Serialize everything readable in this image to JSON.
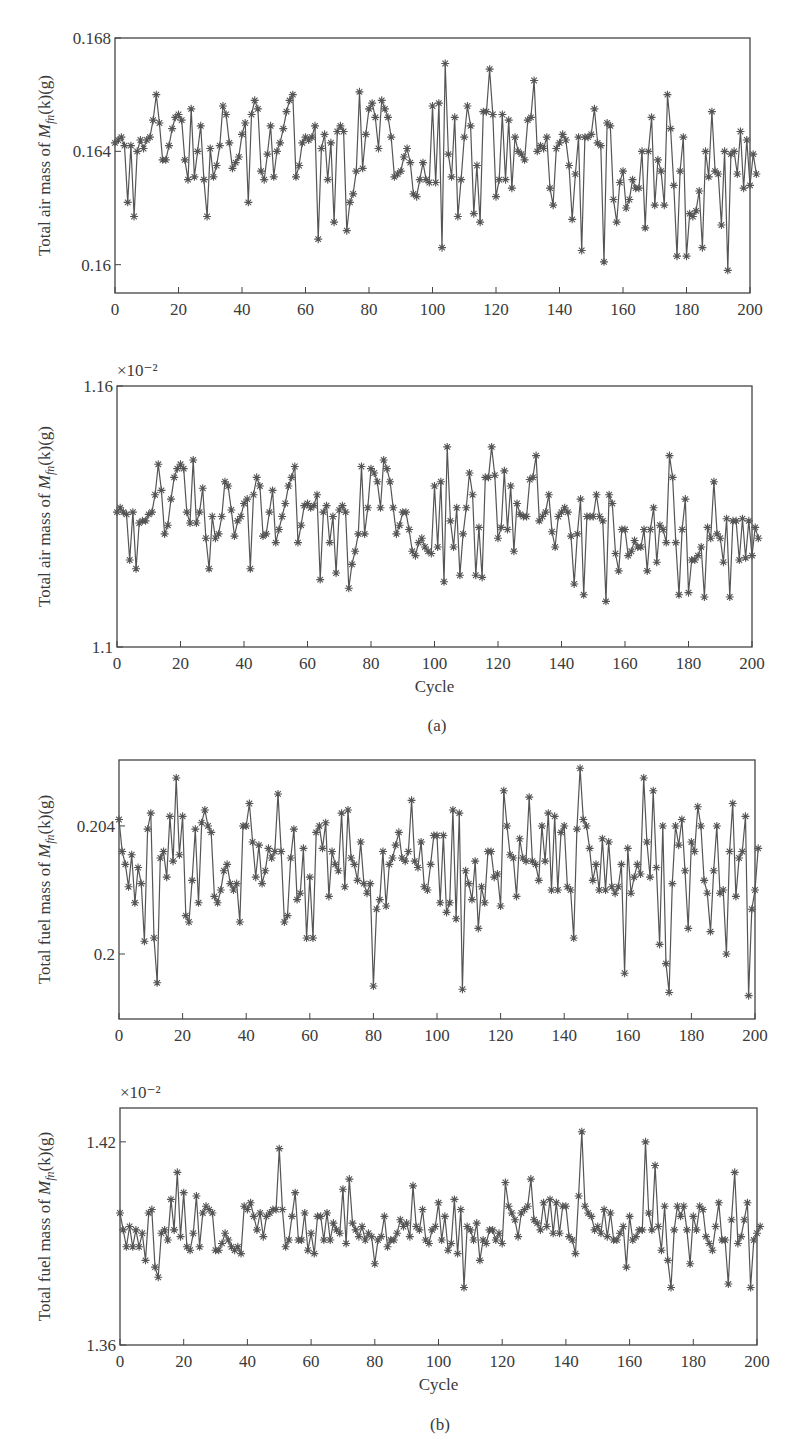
{
  "figure": {
    "panel_a_label": "(a)",
    "panel_b_label": "(b)"
  },
  "chart_data": [
    {
      "id": "air-main",
      "type": "line",
      "marker": "asterisk",
      "color": "#555555",
      "title": "",
      "xlabel": "",
      "ylabel": "Total air mass of M_fn(k)(g)",
      "ylabel_parts": {
        "pre": "Total air mass of ",
        "sym": "M",
        "sub": "fn",
        "post": "(k)(g)"
      },
      "multiplier": "",
      "xlim": [
        0,
        200
      ],
      "ylim": [
        0.159,
        0.168
      ],
      "xticks": [
        0,
        20,
        40,
        60,
        80,
        100,
        120,
        140,
        160,
        180,
        200
      ],
      "yticks": [
        0.16,
        0.164,
        0.168
      ],
      "ytick_labels": [
        "0.16",
        "0.164",
        "0.168"
      ],
      "box": {
        "x": 115,
        "y": 38,
        "w": 635,
        "h": 255
      },
      "grid": false,
      "x": "0..200",
      "values": [
        0.1643,
        0.1644,
        0.1645,
        0.1642,
        0.1622,
        0.1642,
        0.1617,
        0.164,
        0.1644,
        0.1641,
        0.1644,
        0.1645,
        0.1651,
        0.166,
        0.165,
        0.1637,
        0.1637,
        0.1642,
        0.1648,
        0.1652,
        0.1653,
        0.1651,
        0.1637,
        0.163,
        0.1655,
        0.1631,
        0.164,
        0.1649,
        0.163,
        0.1617,
        0.1641,
        0.1631,
        0.1635,
        0.1642,
        0.1656,
        0.1653,
        0.1643,
        0.1634,
        0.1636,
        0.1638,
        0.1646,
        0.165,
        0.1622,
        0.1653,
        0.1658,
        0.1655,
        0.1633,
        0.163,
        0.1639,
        0.1649,
        0.1631,
        0.164,
        0.1643,
        0.1648,
        0.1654,
        0.1658,
        0.166,
        0.1631,
        0.1635,
        0.1643,
        0.1645,
        0.1644,
        0.1645,
        0.1649,
        0.1609,
        0.1641,
        0.1646,
        0.163,
        0.1643,
        0.1615,
        0.1647,
        0.1649,
        0.1647,
        0.1612,
        0.1622,
        0.1625,
        0.1633,
        0.1661,
        0.1634,
        0.1646,
        0.1655,
        0.1657,
        0.1652,
        0.1641,
        0.1658,
        0.1655,
        0.1652,
        0.1645,
        0.1631,
        0.1632,
        0.1633,
        0.1638,
        0.1641,
        0.1636,
        0.1625,
        0.1624,
        0.163,
        0.1636,
        0.163,
        0.1629,
        0.1656,
        0.1629,
        0.1657,
        0.1606,
        0.1671,
        0.1639,
        0.1631,
        0.1652,
        0.1617,
        0.163,
        0.1645,
        0.1656,
        0.1649,
        0.1618,
        0.1635,
        0.1615,
        0.1654,
        0.1654,
        0.1669,
        0.1653,
        0.1624,
        0.163,
        0.1653,
        0.163,
        0.1651,
        0.1627,
        0.1645,
        0.164,
        0.1639,
        0.1637,
        0.1651,
        0.1652,
        0.1665,
        0.164,
        0.1642,
        0.1641,
        0.1645,
        0.1627,
        0.1621,
        0.1641,
        0.1643,
        0.1646,
        0.1644,
        0.1635,
        0.1616,
        0.1632,
        0.1645,
        0.1605,
        0.1645,
        0.1645,
        0.1646,
        0.1655,
        0.1643,
        0.1642,
        0.1601,
        0.165,
        0.1649,
        0.1623,
        0.1615,
        0.1629,
        0.1633,
        0.162,
        0.1623,
        0.163,
        0.1627,
        0.1627,
        0.164,
        0.1613,
        0.164,
        0.1652,
        0.1621,
        0.1637,
        0.1633,
        0.1621,
        0.166,
        0.1648,
        0.1628,
        0.1603,
        0.1633,
        0.1645,
        0.1603,
        0.1618,
        0.1617,
        0.1619,
        0.1626,
        0.1606,
        0.164,
        0.1631,
        0.1654,
        0.1633,
        0.1632,
        0.1614,
        0.164,
        0.1598,
        0.1639,
        0.164,
        0.1632,
        0.1647,
        0.1627,
        0.1644,
        0.1628,
        0.1639,
        0.1632
      ]
    },
    {
      "id": "air-scaled",
      "type": "line",
      "marker": "asterisk",
      "color": "#555555",
      "title": "",
      "xlabel": "Cycle",
      "ylabel": "Total air mass of M_fn(k)(g)",
      "ylabel_parts": {
        "pre": "Total air mass of ",
        "sym": "M",
        "sub": "fn",
        "post": "(k)(g)"
      },
      "multiplier": "×10⁻²",
      "xlim": [
        0,
        200
      ],
      "ylim": [
        1.1,
        1.16
      ],
      "xticks": [
        0,
        20,
        40,
        60,
        80,
        100,
        120,
        140,
        160,
        180,
        200
      ],
      "yticks": [
        1.1,
        1.16
      ],
      "ytick_labels": [
        "1.1",
        "1.16"
      ],
      "box": {
        "x": 117,
        "y": 386,
        "w": 635,
        "h": 261
      },
      "grid": false,
      "x": "0..200",
      "values": [
        1.131,
        1.132,
        1.131,
        1.1305,
        1.12,
        1.131,
        1.118,
        1.1285,
        1.129,
        1.129,
        1.1305,
        1.131,
        1.135,
        1.142,
        1.136,
        1.126,
        1.128,
        1.134,
        1.139,
        1.141,
        1.142,
        1.141,
        1.131,
        1.1285,
        1.143,
        1.1285,
        1.131,
        1.1365,
        1.125,
        1.118,
        1.13,
        1.125,
        1.126,
        1.13,
        1.138,
        1.137,
        1.1315,
        1.1255,
        1.129,
        1.13,
        1.133,
        1.134,
        1.118,
        1.135,
        1.139,
        1.137,
        1.1255,
        1.126,
        1.131,
        1.136,
        1.124,
        1.127,
        1.13,
        1.133,
        1.137,
        1.139,
        1.1415,
        1.124,
        1.128,
        1.1325,
        1.133,
        1.132,
        1.1325,
        1.135,
        1.1155,
        1.131,
        1.1325,
        1.124,
        1.13,
        1.117,
        1.1315,
        1.1325,
        1.131,
        1.1135,
        1.119,
        1.122,
        1.126,
        1.1415,
        1.126,
        1.132,
        1.141,
        1.14,
        1.138,
        1.132,
        1.143,
        1.141,
        1.138,
        1.132,
        1.126,
        1.128,
        1.131,
        1.131,
        1.127,
        1.122,
        1.121,
        1.124,
        1.125,
        1.123,
        1.122,
        1.1215,
        1.137,
        1.123,
        1.138,
        1.115,
        1.146,
        1.129,
        1.123,
        1.132,
        1.1165,
        1.126,
        1.132,
        1.14,
        1.135,
        1.1165,
        1.1275,
        1.116,
        1.139,
        1.139,
        1.146,
        1.1395,
        1.125,
        1.1275,
        1.1405,
        1.127,
        1.137,
        1.122,
        1.133,
        1.1305,
        1.13,
        1.13,
        1.1385,
        1.139,
        1.144,
        1.129,
        1.13,
        1.131,
        1.135,
        1.1265,
        1.123,
        1.13,
        1.131,
        1.132,
        1.131,
        1.1255,
        1.1145,
        1.126,
        1.134,
        1.112,
        1.13,
        1.13,
        1.13,
        1.135,
        1.13,
        1.129,
        1.1105,
        1.135,
        1.133,
        1.1215,
        1.1175,
        1.127,
        1.127,
        1.121,
        1.122,
        1.1245,
        1.123,
        1.123,
        1.127,
        1.1175,
        1.127,
        1.132,
        1.1195,
        1.128,
        1.127,
        1.124,
        1.144,
        1.139,
        1.124,
        1.112,
        1.127,
        1.134,
        1.1125,
        1.12,
        1.12,
        1.121,
        1.123,
        1.1115,
        1.1275,
        1.125,
        1.138,
        1.126,
        1.125,
        1.1195,
        1.1295,
        1.1115,
        1.129,
        1.129,
        1.12,
        1.1295,
        1.1205,
        1.129,
        1.121,
        1.1275,
        1.125
      ]
    },
    {
      "id": "fuel-main",
      "type": "line",
      "marker": "asterisk",
      "color": "#555555",
      "title": "",
      "xlabel": "",
      "ylabel": "Total fuel mass of M_fn(k)(g)",
      "ylabel_parts": {
        "pre": "Total fuel mass of ",
        "sym": "M",
        "sub": "fn",
        "post": "(k)(g)"
      },
      "multiplier": "",
      "xlim": [
        0,
        200
      ],
      "ylim": [
        0.19797,
        0.20606
      ],
      "xticks": [
        0,
        20,
        40,
        60,
        80,
        100,
        120,
        140,
        160,
        180,
        200
      ],
      "yticks": [
        0.2,
        0.204
      ],
      "ytick_labels": [
        "0.2",
        "0.204"
      ],
      "box": {
        "x": 119,
        "y": 760,
        "w": 636,
        "h": 259
      },
      "grid": false,
      "x": "0..200",
      "values": [
        0.2042,
        0.2032,
        0.2028,
        0.2021,
        0.2031,
        0.2016,
        0.2027,
        0.2022,
        0.2004,
        0.2039,
        0.2044,
        0.2005,
        0.1991,
        0.203,
        0.2032,
        0.2024,
        0.2043,
        0.2029,
        0.2055,
        0.2031,
        0.2043,
        0.2012,
        0.201,
        0.2023,
        0.2039,
        0.2016,
        0.2041,
        0.2045,
        0.204,
        0.2038,
        0.2018,
        0.2016,
        0.202,
        0.2026,
        0.2028,
        0.2022,
        0.202,
        0.2022,
        0.201,
        0.204,
        0.204,
        0.2047,
        0.2035,
        0.2024,
        0.2034,
        0.2022,
        0.2026,
        0.2033,
        0.203,
        0.2032,
        0.205,
        0.2032,
        0.201,
        0.2012,
        0.203,
        0.2039,
        0.2017,
        0.2019,
        0.2033,
        0.2005,
        0.2024,
        0.2005,
        0.2038,
        0.204,
        0.2033,
        0.2041,
        0.2018,
        0.2032,
        0.2028,
        0.2026,
        0.2044,
        0.2021,
        0.2045,
        0.203,
        0.2028,
        0.2023,
        0.2035,
        0.2022,
        0.2019,
        0.2022,
        0.199,
        0.2014,
        0.2017,
        0.2032,
        0.2015,
        0.2028,
        0.203,
        0.2034,
        0.2038,
        0.203,
        0.2029,
        0.2032,
        0.2048,
        0.2029,
        0.2027,
        0.2035,
        0.2021,
        0.202,
        0.2028,
        0.2037,
        0.2037,
        0.2016,
        0.2037,
        0.2013,
        0.2016,
        0.2045,
        0.2011,
        0.2044,
        0.1989,
        0.2026,
        0.2022,
        0.2017,
        0.2029,
        0.2008,
        0.2021,
        0.2016,
        0.2032,
        0.2032,
        0.2024,
        0.2025,
        0.2015,
        0.2051,
        0.204,
        0.2031,
        0.203,
        0.2018,
        0.2036,
        0.203,
        0.2029,
        0.2049,
        0.2029,
        0.2028,
        0.2023,
        0.204,
        0.2029,
        0.2044,
        0.202,
        0.2043,
        0.202,
        0.2038,
        0.204,
        0.2021,
        0.202,
        0.2005,
        0.2039,
        0.2058,
        0.2042,
        0.204,
        0.2033,
        0.2023,
        0.2028,
        0.202,
        0.2036,
        0.202,
        0.2035,
        0.2021,
        0.2019,
        0.2021,
        0.2028,
        0.1994,
        0.2033,
        0.2019,
        0.2024,
        0.2028,
        0.2025,
        0.2055,
        0.2035,
        0.2024,
        0.2051,
        0.2027,
        0.2003,
        0.204,
        0.1997,
        0.1988,
        0.2022,
        0.204,
        0.2034,
        0.2042,
        0.2026,
        0.2008,
        0.2035,
        0.2032,
        0.2046,
        0.204,
        0.2023,
        0.2019,
        0.2007,
        0.2026,
        0.204,
        0.2019,
        0.202,
        0.2,
        0.2032,
        0.2047,
        0.2018,
        0.203,
        0.2032,
        0.2043,
        0.1987,
        0.2014,
        0.202,
        0.2033
      ]
    },
    {
      "id": "fuel-scaled",
      "type": "line",
      "marker": "asterisk",
      "color": "#555555",
      "title": "",
      "xlabel": "Cycle",
      "ylabel": "Total fuel mass of M_fn(k)(g)",
      "ylabel_parts": {
        "pre": "Total fuel mass of ",
        "sym": "M",
        "sub": "fn",
        "post": "(k)(g)"
      },
      "multiplier": "×10⁻²",
      "xlim": [
        0,
        200
      ],
      "ylim": [
        1.36,
        1.43
      ],
      "xticks": [
        0,
        20,
        40,
        60,
        80,
        100,
        120,
        140,
        160,
        180,
        200
      ],
      "yticks": [
        1.36,
        1.42
      ],
      "ytick_labels": [
        "1.36",
        "1.42"
      ],
      "box": {
        "x": 120,
        "y": 1108,
        "w": 637,
        "h": 237
      },
      "grid": false,
      "x": "0..200",
      "values": [
        1.399,
        1.394,
        1.389,
        1.395,
        1.389,
        1.394,
        1.389,
        1.393,
        1.385,
        1.399,
        1.4,
        1.383,
        1.38,
        1.393,
        1.394,
        1.391,
        1.403,
        1.394,
        1.411,
        1.392,
        1.405,
        1.389,
        1.388,
        1.393,
        1.404,
        1.389,
        1.399,
        1.401,
        1.4,
        1.399,
        1.388,
        1.388,
        1.39,
        1.393,
        1.391,
        1.389,
        1.388,
        1.389,
        1.387,
        1.401,
        1.4,
        1.402,
        1.398,
        1.394,
        1.399,
        1.392,
        1.398,
        1.399,
        1.4,
        1.4,
        1.418,
        1.4,
        1.389,
        1.391,
        1.398,
        1.405,
        1.391,
        1.391,
        1.399,
        1.388,
        1.393,
        1.387,
        1.398,
        1.398,
        1.391,
        1.399,
        1.391,
        1.396,
        1.394,
        1.393,
        1.406,
        1.39,
        1.409,
        1.396,
        1.394,
        1.392,
        1.395,
        1.391,
        1.393,
        1.392,
        1.384,
        1.391,
        1.392,
        1.398,
        1.389,
        1.391,
        1.391,
        1.393,
        1.397,
        1.395,
        1.396,
        1.392,
        1.407,
        1.395,
        1.394,
        1.4,
        1.391,
        1.39,
        1.394,
        1.395,
        1.402,
        1.391,
        1.398,
        1.388,
        1.39,
        1.403,
        1.387,
        1.4,
        1.377,
        1.395,
        1.394,
        1.391,
        1.396,
        1.385,
        1.391,
        1.39,
        1.394,
        1.394,
        1.391,
        1.393,
        1.39,
        1.408,
        1.401,
        1.399,
        1.397,
        1.392,
        1.399,
        1.4,
        1.401,
        1.409,
        1.397,
        1.396,
        1.394,
        1.402,
        1.395,
        1.403,
        1.393,
        1.402,
        1.393,
        1.401,
        1.401,
        1.392,
        1.391,
        1.387,
        1.404,
        1.423,
        1.401,
        1.399,
        1.398,
        1.394,
        1.395,
        1.393,
        1.4,
        1.392,
        1.399,
        1.391,
        1.391,
        1.393,
        1.395,
        1.383,
        1.398,
        1.391,
        1.392,
        1.394,
        1.394,
        1.42,
        1.399,
        1.394,
        1.413,
        1.395,
        1.388,
        1.401,
        1.385,
        1.377,
        1.394,
        1.401,
        1.398,
        1.401,
        1.394,
        1.384,
        1.398,
        1.394,
        1.401,
        1.4,
        1.392,
        1.39,
        1.388,
        1.395,
        1.402,
        1.391,
        1.391,
        1.378,
        1.397,
        1.411,
        1.39,
        1.392,
        1.397,
        1.402,
        1.377,
        1.391,
        1.393,
        1.395
      ]
    }
  ]
}
